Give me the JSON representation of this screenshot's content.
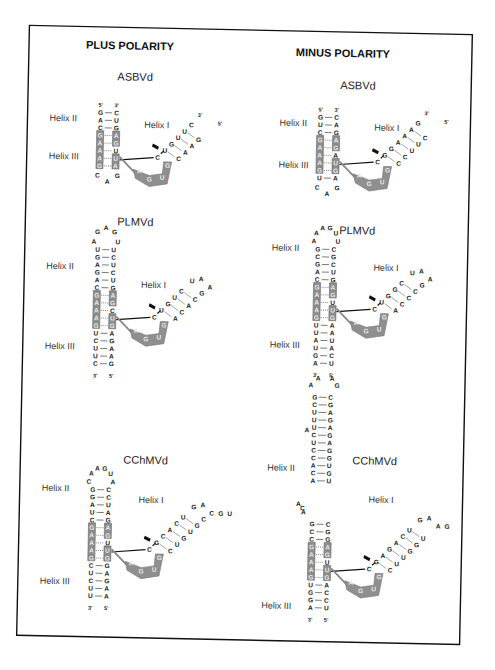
{
  "columns": [
    {
      "title": "PLUS POLARITY"
    },
    {
      "title": "MINUS POLARITY"
    }
  ],
  "labels": {
    "helix1": "Helix I",
    "helix2": "Helix II",
    "helix3": "Helix III",
    "five_prime": "5'",
    "three_prime": "3'"
  },
  "panels": [
    {
      "id": "plus-asbvd",
      "title": "ASBVd",
      "stem_left": [
        "G",
        "A",
        "C",
        "G",
        "A",
        "A",
        "A",
        "G"
      ],
      "stem_right": [
        "C",
        "U",
        "G",
        "A",
        "G",
        "U",
        "U",
        "A"
      ],
      "boxed_left": [
        3,
        4,
        5,
        6,
        7
      ],
      "boxed_right": [
        3,
        4,
        6,
        7
      ],
      "loop_bottom": [
        "C",
        "A",
        "G"
      ],
      "helix1_left": [
        "U",
        "G",
        "U",
        "U",
        "C"
      ],
      "helix1_right": [
        "C",
        "A",
        "A",
        "G"
      ],
      "ribbon": [
        "A",
        "G",
        "U",
        "G"
      ],
      "cleavage_nt": "C"
    },
    {
      "id": "plus-plmvd",
      "title": "PLMVd",
      "loop_top": [
        "A",
        "G",
        "A",
        "G",
        "U"
      ],
      "stem_left": [
        "U",
        "G",
        "A",
        "G",
        "A",
        "C",
        "G",
        "A",
        "A",
        "A",
        "G",
        "U",
        "C",
        "U",
        "U",
        "C"
      ],
      "stem_right": [
        "U",
        "C",
        "U",
        "C",
        "U",
        "G",
        "A",
        "G",
        "C",
        "U",
        "G",
        "A",
        "G",
        "A",
        "A",
        "G"
      ],
      "helix1_left": [
        "U",
        "G",
        "U",
        "C"
      ],
      "helix1_right": [
        "A",
        "C",
        "A",
        "C",
        "G"
      ],
      "helix1_loop": [
        "U",
        "A",
        "A"
      ],
      "ribbon": [
        "A",
        "G",
        "U",
        "G"
      ],
      "cleavage_nt": "C"
    },
    {
      "id": "plus-cchmvd",
      "title": "CChMVd",
      "loop_top": [
        "C",
        "A",
        "A",
        "G",
        "U",
        "A"
      ],
      "stem_left": [
        "G",
        "G",
        "A",
        "U",
        "C",
        "G",
        "A",
        "A",
        "A",
        "G",
        "C",
        "U",
        "C",
        "U",
        "U"
      ],
      "stem_right": [
        "C",
        "C",
        "U",
        "A",
        "G",
        "A",
        "G",
        "U",
        "U",
        "G",
        "G",
        "A",
        "G",
        "A",
        "A"
      ],
      "bulge": "A",
      "helix1_left": [
        "G",
        "C",
        "A",
        "C",
        "U"
      ],
      "helix1_right": [
        "C",
        "U",
        "G",
        "U",
        "G",
        "C"
      ],
      "helix1_loop": [
        "G",
        "A",
        "C",
        "G",
        "U"
      ],
      "ribbon": [
        "A",
        "G",
        "U",
        "G"
      ],
      "cleavage_nt": "C"
    },
    {
      "id": "minus-asbvd",
      "title": "ASBVd",
      "stem_left": [
        "G",
        "U",
        "C",
        "G",
        "A",
        "A",
        "A",
        "G",
        "U"
      ],
      "stem_right": [
        "C",
        "A",
        "G",
        "A",
        "G",
        "A",
        "U",
        "G",
        "A"
      ],
      "loop_bottom": [
        "C",
        "A",
        "G"
      ],
      "helix1_left": [
        "G",
        "G",
        "A",
        "A",
        "A",
        "G"
      ],
      "helix1_right": [
        "C",
        "C",
        "U",
        "U",
        "C"
      ],
      "ribbon": [
        "A",
        "G",
        "U",
        "G"
      ],
      "cleavage_nt": "C"
    },
    {
      "id": "minus-plmvd",
      "title": "PLMVd",
      "loop_top": [
        "A",
        "A",
        "A",
        "G",
        "U",
        "U"
      ],
      "stem_left": [
        "G",
        "C",
        "G",
        "A",
        "C",
        "G",
        "A",
        "A",
        "A",
        "G",
        "U",
        "U",
        "A",
        "U",
        "G",
        "A"
      ],
      "stem_right": [
        "C",
        "G",
        "C",
        "U",
        "G",
        "A",
        "G",
        "U",
        "U",
        "G",
        "A",
        "A",
        "U",
        "A",
        "C",
        "U"
      ],
      "helix1_left": [
        "U",
        "G",
        "G",
        "C"
      ],
      "helix1_right": [
        "A",
        "C",
        "C",
        "C",
        "G"
      ],
      "helix1_loop": [
        "U",
        "A",
        "A"
      ],
      "ribbon": [
        "A",
        "G",
        "U",
        "G"
      ],
      "cleavage_nt": "C"
    },
    {
      "id": "minus-cchmvd",
      "title": "CChMVd",
      "loop_top": [
        "A",
        "A",
        "A",
        "G"
      ],
      "stem_upper_left": [
        "G",
        "C",
        "U",
        "U",
        "U",
        "C",
        "U",
        "C",
        "C",
        "A",
        "C",
        "A"
      ],
      "stem_upper_right": [
        "C",
        "G",
        "A",
        "G",
        "A",
        "G",
        "A",
        "G",
        "G",
        "U",
        "G",
        "U"
      ],
      "bulges": [
        "A",
        "C",
        "A",
        "A"
      ],
      "stem_left": [
        "G",
        "C",
        "C",
        "G",
        "A",
        "A",
        "A",
        "G",
        "U",
        "G",
        "G",
        "A"
      ],
      "stem_right": [
        "C",
        "G",
        "G",
        "A",
        "G",
        "U",
        "U",
        "G",
        "A",
        "C",
        "C",
        "U"
      ],
      "helix1_left": [
        "G",
        "A",
        "G",
        "A",
        "C",
        "U"
      ],
      "helix1_right": [
        "C",
        "U",
        "U",
        "G",
        "G",
        "U"
      ],
      "helix1_loop": [
        "G",
        "A",
        "A",
        "G"
      ],
      "ribbon": [
        "A",
        "G",
        "U",
        "G"
      ],
      "cleavage_nt": "C"
    }
  ]
}
